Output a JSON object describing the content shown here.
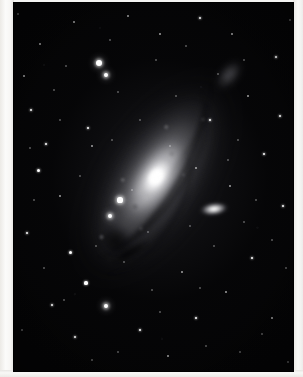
{
  "image": {
    "subject": "Andromeda Galaxy (M31)",
    "type": "astronomical photograph",
    "rendering": "grayscale monochrome plate",
    "alt_text": "Black and white astrophotograph of the Andromeda Galaxy tilted diagonally from lower-left to upper-right, with a bright elongated nucleus, sweeping dust lanes, two companion galaxies, and a dense field of foreground stars."
  },
  "plate": {
    "label": "m31-plate",
    "background_color": "#040405",
    "left_px": 13,
    "top_px": 2,
    "width_px": 281,
    "height_px": 370
  },
  "paper": {
    "margin_color": "#f6f5f3",
    "left_margin_px": 14,
    "right_margin_px": 10,
    "bottom_margin_px": 7
  },
  "objects": [
    {
      "name": "m31-galaxy",
      "label": "M31 spiral disk",
      "center_x": 161,
      "center_y": 181,
      "position_angle_deg": -57,
      "core_color": "#ffffff",
      "disk_color": "#8a8a8e"
    },
    {
      "name": "m31-nucleus",
      "label": "M31 bright nucleus",
      "center_x": 161,
      "center_y": 181,
      "color": "#ffffff"
    },
    {
      "name": "m32-companion",
      "label": "M32 companion galaxy",
      "center_x": 201,
      "center_y": 207,
      "color": "#ffffff"
    },
    {
      "name": "m110-companion",
      "label": "M110 companion galaxy",
      "center_x": 216,
      "center_y": 73,
      "color": "#a8a8ae"
    },
    {
      "name": "dust-lane",
      "label": "dark dust lane",
      "center_x": 103,
      "center_y": 239,
      "color": "#020203"
    }
  ],
  "stars": [
    {
      "x": 99,
      "y": 63,
      "r": 3.2,
      "class": "b"
    },
    {
      "x": 106,
      "y": 75,
      "r": 2.4,
      "class": "b"
    },
    {
      "x": 120,
      "y": 200,
      "r": 2.6,
      "class": "b"
    },
    {
      "x": 110,
      "y": 216,
      "r": 2.0,
      "class": "b"
    },
    {
      "x": 106,
      "y": 306,
      "r": 2.4,
      "class": "b"
    },
    {
      "x": 86,
      "y": 283,
      "r": 1.6,
      "class": "m"
    },
    {
      "x": 70,
      "y": 252,
      "r": 1.5,
      "class": "m"
    },
    {
      "x": 38,
      "y": 170,
      "r": 1.5,
      "class": "m"
    },
    {
      "x": 31,
      "y": 110,
      "r": 1.4,
      "class": "m"
    },
    {
      "x": 46,
      "y": 144,
      "r": 1.3,
      "class": "m"
    },
    {
      "x": 88,
      "y": 128,
      "r": 1.3,
      "class": "m"
    },
    {
      "x": 92,
      "y": 146,
      "r": 1.2,
      "class": "f"
    },
    {
      "x": 60,
      "y": 196,
      "r": 1.2,
      "class": "f"
    },
    {
      "x": 27,
      "y": 233,
      "r": 1.3,
      "class": "m"
    },
    {
      "x": 52,
      "y": 305,
      "r": 1.4,
      "class": "m"
    },
    {
      "x": 75,
      "y": 337,
      "r": 1.3,
      "class": "m"
    },
    {
      "x": 140,
      "y": 330,
      "r": 1.4,
      "class": "m"
    },
    {
      "x": 168,
      "y": 356,
      "r": 1.2,
      "class": "f"
    },
    {
      "x": 196,
      "y": 318,
      "r": 1.3,
      "class": "m"
    },
    {
      "x": 226,
      "y": 292,
      "r": 1.2,
      "class": "f"
    },
    {
      "x": 252,
      "y": 258,
      "r": 1.3,
      "class": "m"
    },
    {
      "x": 272,
      "y": 318,
      "r": 1.2,
      "class": "f"
    },
    {
      "x": 283,
      "y": 206,
      "r": 1.3,
      "class": "m"
    },
    {
      "x": 264,
      "y": 154,
      "r": 1.4,
      "class": "m"
    },
    {
      "x": 280,
      "y": 116,
      "r": 1.3,
      "class": "m"
    },
    {
      "x": 248,
      "y": 96,
      "r": 1.2,
      "class": "f"
    },
    {
      "x": 276,
      "y": 57,
      "r": 1.3,
      "class": "m"
    },
    {
      "x": 232,
      "y": 34,
      "r": 1.2,
      "class": "f"
    },
    {
      "x": 200,
      "y": 18,
      "r": 1.3,
      "class": "m"
    },
    {
      "x": 160,
      "y": 34,
      "r": 1.2,
      "class": "f"
    },
    {
      "x": 128,
      "y": 16,
      "r": 1.2,
      "class": "f"
    },
    {
      "x": 74,
      "y": 22,
      "r": 1.2,
      "class": "f"
    },
    {
      "x": 40,
      "y": 44,
      "r": 1.2,
      "class": "f"
    },
    {
      "x": 24,
      "y": 76,
      "r": 1.1,
      "class": "f"
    },
    {
      "x": 210,
      "y": 120,
      "r": 1.4,
      "class": "m"
    },
    {
      "x": 238,
      "y": 140,
      "r": 1.1,
      "class": "vf"
    },
    {
      "x": 196,
      "y": 168,
      "r": 1.2,
      "class": "f"
    },
    {
      "x": 230,
      "y": 186,
      "r": 1.2,
      "class": "f"
    },
    {
      "x": 244,
      "y": 222,
      "r": 1.1,
      "class": "vf"
    },
    {
      "x": 214,
      "y": 246,
      "r": 1.1,
      "class": "vf"
    },
    {
      "x": 182,
      "y": 272,
      "r": 1.2,
      "class": "f"
    },
    {
      "x": 152,
      "y": 290,
      "r": 1.1,
      "class": "vf"
    },
    {
      "x": 124,
      "y": 262,
      "r": 1.1,
      "class": "vf"
    },
    {
      "x": 140,
      "y": 120,
      "r": 1.1,
      "class": "vf"
    },
    {
      "x": 176,
      "y": 96,
      "r": 1.1,
      "class": "vf"
    },
    {
      "x": 156,
      "y": 60,
      "r": 1.1,
      "class": "vf"
    },
    {
      "x": 118,
      "y": 92,
      "r": 1.1,
      "class": "vf"
    },
    {
      "x": 60,
      "y": 120,
      "r": 1.0,
      "class": "vf"
    },
    {
      "x": 44,
      "y": 268,
      "r": 1.0,
      "class": "vf"
    },
    {
      "x": 92,
      "y": 360,
      "r": 1.0,
      "class": "vf"
    },
    {
      "x": 240,
      "y": 352,
      "r": 1.0,
      "class": "vf"
    },
    {
      "x": 286,
      "y": 268,
      "r": 1.0,
      "class": "vf"
    },
    {
      "x": 288,
      "y": 362,
      "r": 1.0,
      "class": "vf"
    },
    {
      "x": 22,
      "y": 330,
      "r": 1.0,
      "class": "vf"
    },
    {
      "x": 18,
      "y": 14,
      "r": 1.0,
      "class": "vf"
    },
    {
      "x": 290,
      "y": 20,
      "r": 1.0,
      "class": "vf"
    },
    {
      "x": 256,
      "y": 200,
      "r": 1.0,
      "class": "vf"
    },
    {
      "x": 206,
      "y": 346,
      "r": 1.0,
      "class": "vf"
    },
    {
      "x": 66,
      "y": 66,
      "r": 1.0,
      "class": "vf"
    },
    {
      "x": 112,
      "y": 140,
      "r": 1.0,
      "class": "vf"
    },
    {
      "x": 190,
      "y": 226,
      "r": 1.0,
      "class": "vf"
    },
    {
      "x": 148,
      "y": 232,
      "r": 1.0,
      "class": "vf"
    },
    {
      "x": 132,
      "y": 190,
      "r": 1.0,
      "class": "vf"
    },
    {
      "x": 170,
      "y": 146,
      "r": 1.0,
      "class": "vf"
    },
    {
      "x": 218,
      "y": 74,
      "r": 1.0,
      "class": "vf"
    },
    {
      "x": 54,
      "y": 90,
      "r": 1.0,
      "class": "vf"
    },
    {
      "x": 34,
      "y": 200,
      "r": 1.0,
      "class": "vf"
    },
    {
      "x": 80,
      "y": 176,
      "r": 1.0,
      "class": "vf"
    },
    {
      "x": 96,
      "y": 246,
      "r": 1.0,
      "class": "vf"
    },
    {
      "x": 64,
      "y": 300,
      "r": 1.0,
      "class": "vf"
    },
    {
      "x": 118,
      "y": 352,
      "r": 1.0,
      "class": "vf"
    },
    {
      "x": 262,
      "y": 334,
      "r": 1.0,
      "class": "vf"
    },
    {
      "x": 200,
      "y": 288,
      "r": 1.0,
      "class": "vf"
    },
    {
      "x": 272,
      "y": 240,
      "r": 1.0,
      "class": "vf"
    },
    {
      "x": 244,
      "y": 60,
      "r": 1.0,
      "class": "vf"
    },
    {
      "x": 186,
      "y": 46,
      "r": 1.0,
      "class": "vf"
    },
    {
      "x": 110,
      "y": 40,
      "r": 1.0,
      "class": "vf"
    },
    {
      "x": 30,
      "y": 148,
      "r": 1.0,
      "class": "vf"
    },
    {
      "x": 160,
      "y": 312,
      "r": 1.0,
      "class": "vf"
    },
    {
      "x": 228,
      "y": 160,
      "r": 1.0,
      "class": "vf"
    }
  ]
}
